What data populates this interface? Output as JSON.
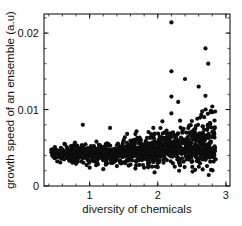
{
  "chart_data": {
    "type": "scatter",
    "title": "",
    "subtitle": "",
    "xlabel": "diversity of chemicals",
    "ylabel": "growth speed of an ensemble (a.u)",
    "xlim": [
      0.33,
      3.06
    ],
    "ylim": [
      0.0,
      0.0225
    ],
    "grid": false,
    "legend": null,
    "xticks": [
      1,
      2,
      3
    ],
    "xticklabels": [
      "1",
      "2",
      "3"
    ],
    "yticks": [
      0,
      0.01,
      0.02
    ],
    "yticklabels": [
      "0",
      "0.01",
      "0.02"
    ],
    "x_minor_tick_step": 0.2,
    "y_minor_tick_step": 0.002,
    "marker": "filled-circle",
    "marker_color": "#0d0d0d",
    "marker_size_px": 2.1,
    "n_points": 1180,
    "annotations": [],
    "series": [
      {
        "name": "ensembles",
        "description": "dense low band near 0.004 broadening and rising with diversity, plus sparse high-growth outliers",
        "points": [
          [
            0.44,
            0.0044
          ],
          [
            0.45,
            0.0041
          ],
          [
            0.47,
            0.0046
          ],
          [
            0.48,
            0.004
          ],
          [
            0.49,
            0.0043
          ],
          [
            0.5,
            0.0045
          ],
          [
            0.51,
            0.0038
          ],
          [
            0.52,
            0.0047
          ],
          [
            0.53,
            0.0042
          ],
          [
            0.54,
            0.0044
          ],
          [
            0.55,
            0.0039
          ],
          [
            0.56,
            0.0046
          ],
          [
            0.57,
            0.0043
          ],
          [
            0.58,
            0.0041
          ],
          [
            0.59,
            0.0045
          ],
          [
            0.6,
            0.0048
          ],
          [
            0.6,
            0.0036
          ],
          [
            0.61,
            0.0043
          ],
          [
            0.62,
            0.0044
          ],
          [
            0.63,
            0.004
          ],
          [
            0.63,
            0.0055
          ],
          [
            0.64,
            0.0046
          ],
          [
            0.65,
            0.0042
          ],
          [
            0.66,
            0.0045
          ],
          [
            0.67,
            0.0038
          ],
          [
            0.68,
            0.0044
          ],
          [
            0.69,
            0.0047
          ],
          [
            0.7,
            0.0041
          ],
          [
            0.7,
            0.0033
          ],
          [
            0.71,
            0.0045
          ],
          [
            0.72,
            0.0043
          ],
          [
            0.73,
            0.0046
          ],
          [
            0.74,
            0.004
          ],
          [
            0.75,
            0.0044
          ],
          [
            0.76,
            0.0048
          ],
          [
            0.77,
            0.0042
          ],
          [
            0.78,
            0.0045
          ],
          [
            0.79,
            0.0039
          ],
          [
            0.8,
            0.0044
          ],
          [
            0.8,
            0.0029
          ],
          [
            0.81,
            0.0046
          ],
          [
            0.82,
            0.0043
          ],
          [
            0.83,
            0.0041
          ],
          [
            0.84,
            0.0047
          ],
          [
            0.85,
            0.0044
          ],
          [
            0.86,
            0.0038
          ],
          [
            0.87,
            0.0045
          ],
          [
            0.88,
            0.0042
          ],
          [
            0.89,
            0.0046
          ],
          [
            0.9,
            0.0043
          ],
          [
            0.9,
            0.008
          ],
          [
            0.91,
            0.004
          ],
          [
            0.92,
            0.0044
          ],
          [
            0.93,
            0.0048
          ],
          [
            0.94,
            0.0041
          ],
          [
            0.95,
            0.0045
          ],
          [
            0.96,
            0.0043
          ],
          [
            0.97,
            0.0036
          ],
          [
            0.98,
            0.0046
          ],
          [
            0.99,
            0.0042
          ],
          [
            1.0,
            0.0044
          ],
          [
            1.0,
            0.0024
          ],
          [
            1.01,
            0.0047
          ],
          [
            1.02,
            0.004
          ],
          [
            1.03,
            0.0045
          ],
          [
            1.04,
            0.0043
          ],
          [
            1.05,
            0.0038
          ],
          [
            1.06,
            0.0046
          ],
          [
            1.07,
            0.0044
          ],
          [
            1.08,
            0.0041
          ],
          [
            1.09,
            0.0048
          ],
          [
            1.1,
            0.0043
          ],
          [
            1.1,
            0.0058
          ],
          [
            1.11,
            0.0045
          ],
          [
            1.12,
            0.0039
          ],
          [
            1.13,
            0.0044
          ],
          [
            1.14,
            0.0047
          ],
          [
            1.15,
            0.0042
          ],
          [
            1.16,
            0.0045
          ],
          [
            1.17,
            0.004
          ],
          [
            1.18,
            0.0046
          ],
          [
            1.19,
            0.0043
          ],
          [
            1.2,
            0.0044
          ],
          [
            1.2,
            0.0022
          ],
          [
            1.21,
            0.0048
          ],
          [
            1.22,
            0.0041
          ],
          [
            1.23,
            0.0045
          ],
          [
            1.24,
            0.0043
          ],
          [
            1.25,
            0.0037
          ],
          [
            1.26,
            0.0046
          ],
          [
            1.27,
            0.0044
          ],
          [
            1.28,
            0.0042
          ],
          [
            1.29,
            0.0047
          ],
          [
            1.3,
            0.0043
          ],
          [
            1.3,
            0.0076
          ],
          [
            1.31,
            0.0045
          ],
          [
            1.32,
            0.004
          ],
          [
            1.33,
            0.0044
          ],
          [
            1.34,
            0.0048
          ],
          [
            1.35,
            0.0041
          ],
          [
            1.36,
            0.0046
          ],
          [
            1.37,
            0.0043
          ],
          [
            1.38,
            0.0045
          ],
          [
            1.39,
            0.0039
          ],
          [
            1.4,
            0.0044
          ],
          [
            1.4,
            0.0026
          ],
          [
            1.41,
            0.0047
          ],
          [
            1.42,
            0.0042
          ],
          [
            1.43,
            0.0045
          ],
          [
            1.44,
            0.0043
          ],
          [
            1.45,
            0.005
          ],
          [
            1.46,
            0.0041
          ],
          [
            1.47,
            0.0046
          ],
          [
            1.48,
            0.0044
          ],
          [
            1.49,
            0.0038
          ],
          [
            1.5,
            0.0045
          ],
          [
            1.5,
            0.006
          ],
          [
            1.51,
            0.0043
          ],
          [
            1.52,
            0.0047
          ],
          [
            1.53,
            0.004
          ],
          [
            1.54,
            0.0044
          ],
          [
            1.55,
            0.0046
          ],
          [
            1.56,
            0.0042
          ],
          [
            1.57,
            0.0045
          ],
          [
            1.58,
            0.0043
          ],
          [
            1.59,
            0.0048
          ],
          [
            1.6,
            0.0044
          ],
          [
            1.6,
            0.0028
          ],
          [
            1.61,
            0.0041
          ],
          [
            1.62,
            0.0046
          ],
          [
            1.63,
            0.0043
          ],
          [
            1.64,
            0.0045
          ],
          [
            1.65,
            0.0039
          ],
          [
            1.66,
            0.0047
          ],
          [
            1.67,
            0.0044
          ],
          [
            1.68,
            0.0042
          ],
          [
            1.69,
            0.0046
          ],
          [
            1.7,
            0.0043
          ],
          [
            1.7,
            0.0063
          ],
          [
            1.71,
            0.0045
          ],
          [
            1.72,
            0.004
          ],
          [
            1.73,
            0.0048
          ],
          [
            1.74,
            0.0044
          ],
          [
            1.75,
            0.0041
          ],
          [
            1.76,
            0.0046
          ],
          [
            1.77,
            0.0043
          ],
          [
            1.78,
            0.0045
          ],
          [
            1.79,
            0.0037
          ],
          [
            1.8,
            0.0044
          ],
          [
            1.8,
            0.0024
          ],
          [
            1.81,
            0.0047
          ],
          [
            1.82,
            0.0042
          ],
          [
            1.83,
            0.0046
          ],
          [
            1.84,
            0.0043
          ],
          [
            1.85,
            0.0052
          ],
          [
            1.86,
            0.0045
          ],
          [
            1.87,
            0.004
          ],
          [
            1.88,
            0.0044
          ],
          [
            1.89,
            0.0048
          ],
          [
            1.9,
            0.0043
          ],
          [
            1.9,
            0.0068
          ],
          [
            1.91,
            0.0046
          ],
          [
            1.92,
            0.0041
          ],
          [
            1.93,
            0.0045
          ],
          [
            1.94,
            0.0044
          ],
          [
            1.95,
            0.0038
          ],
          [
            1.96,
            0.0047
          ],
          [
            1.97,
            0.0043
          ],
          [
            1.98,
            0.0045
          ],
          [
            1.99,
            0.0042
          ],
          [
            2.0,
            0.0046
          ],
          [
            2.0,
            0.003
          ],
          [
            2.01,
            0.0044
          ],
          [
            2.02,
            0.0048
          ],
          [
            2.03,
            0.0041
          ],
          [
            2.04,
            0.0045
          ],
          [
            2.05,
            0.0055
          ],
          [
            2.06,
            0.0043
          ],
          [
            2.07,
            0.0047
          ],
          [
            2.08,
            0.004
          ],
          [
            2.09,
            0.0046
          ],
          [
            2.1,
            0.0044
          ],
          [
            2.1,
            0.007
          ],
          [
            2.11,
            0.0042
          ],
          [
            2.12,
            0.0048
          ],
          [
            2.13,
            0.0045
          ],
          [
            2.14,
            0.0043
          ],
          [
            2.15,
            0.005
          ],
          [
            2.16,
            0.0046
          ],
          [
            2.17,
            0.0041
          ],
          [
            2.18,
            0.0044
          ],
          [
            2.19,
            0.0047
          ],
          [
            2.2,
            0.0045
          ],
          [
            2.2,
            0.0214
          ],
          [
            2.2,
            0.015
          ],
          [
            2.2,
            0.0117
          ],
          [
            2.2,
            0.0095
          ],
          [
            2.21,
            0.0043
          ],
          [
            2.22,
            0.0048
          ],
          [
            2.23,
            0.0046
          ],
          [
            2.24,
            0.0044
          ],
          [
            2.25,
            0.006
          ],
          [
            2.26,
            0.0042
          ],
          [
            2.27,
            0.0047
          ],
          [
            2.28,
            0.0045
          ],
          [
            2.29,
            0.005
          ],
          [
            2.3,
            0.0043
          ],
          [
            2.3,
            0.011
          ],
          [
            2.31,
            0.0048
          ],
          [
            2.32,
            0.0046
          ],
          [
            2.33,
            0.0044
          ],
          [
            2.34,
            0.0055
          ],
          [
            2.35,
            0.0042
          ],
          [
            2.36,
            0.0049
          ],
          [
            2.37,
            0.0045
          ],
          [
            2.38,
            0.0058
          ],
          [
            2.39,
            0.0043
          ],
          [
            2.4,
            0.0047
          ],
          [
            2.4,
            0.014
          ],
          [
            2.41,
            0.0051
          ],
          [
            2.42,
            0.0045
          ],
          [
            2.43,
            0.0062
          ],
          [
            2.44,
            0.0044
          ],
          [
            2.45,
            0.0048
          ],
          [
            2.46,
            0.007
          ],
          [
            2.47,
            0.0046
          ],
          [
            2.48,
            0.0053
          ],
          [
            2.49,
            0.0043
          ],
          [
            2.5,
            0.0049
          ],
          [
            2.5,
            0.0085
          ],
          [
            2.51,
            0.0045
          ],
          [
            2.52,
            0.0065
          ],
          [
            2.53,
            0.0047
          ],
          [
            2.54,
            0.0044
          ],
          [
            2.55,
            0.0075
          ],
          [
            2.56,
            0.005
          ],
          [
            2.57,
            0.0046
          ],
          [
            2.58,
            0.0088
          ],
          [
            2.59,
            0.0043
          ],
          [
            2.6,
            0.0052
          ],
          [
            2.6,
            0.013
          ],
          [
            2.61,
            0.0048
          ],
          [
            2.62,
            0.0068
          ],
          [
            2.63,
            0.0045
          ],
          [
            2.64,
            0.0056
          ],
          [
            2.65,
            0.0042
          ],
          [
            2.66,
            0.0078
          ],
          [
            2.67,
            0.0047
          ],
          [
            2.68,
            0.009
          ],
          [
            2.69,
            0.0044
          ],
          [
            2.7,
            0.0054
          ],
          [
            2.7,
            0.018
          ],
          [
            2.7,
            0.0118
          ],
          [
            2.71,
            0.0049
          ],
          [
            2.72,
            0.0066
          ],
          [
            2.73,
            0.0045
          ],
          [
            2.74,
            0.016
          ],
          [
            2.75,
            0.0051
          ],
          [
            2.76,
            0.0082
          ],
          [
            2.77,
            0.0043
          ],
          [
            2.78,
            0.0058
          ],
          [
            2.79,
            0.0047
          ],
          [
            2.8,
            0.0044
          ],
          [
            2.8,
            0.0104
          ],
          [
            2.81,
            0.0038
          ],
          [
            2.82,
            0.005
          ],
          [
            2.83,
            0.0041
          ],
          [
            2.84,
            0.0046
          ],
          [
            2.85,
            0.0035
          ]
        ]
      }
    ]
  }
}
